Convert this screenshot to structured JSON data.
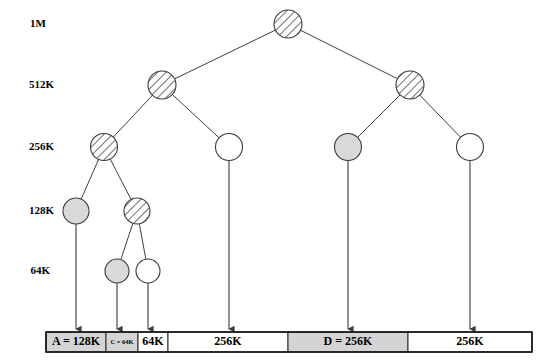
{
  "figure": {
    "colors": {
      "node_stroke": "#3a3a3a",
      "edge_stroke": "#3f3f3f",
      "fill_allocated": "#d9d9d9",
      "fill_free": "#ffffff",
      "hatch_stroke": "#4d4d4d",
      "segment_allocated": "#d4d4d4",
      "segment_free": "#ffffff",
      "text": "#000000"
    }
  },
  "levels": [
    {
      "label": "1M",
      "x": 46,
      "y": 27
    },
    {
      "label": "512K",
      "x": 54,
      "y": 88
    },
    {
      "label": "256K",
      "x": 54,
      "y": 150
    },
    {
      "label": "128K",
      "x": 54,
      "y": 214
    },
    {
      "label": "64K",
      "x": 50,
      "y": 274
    }
  ],
  "nodes": [
    {
      "id": "root",
      "level": "1M",
      "x": 288,
      "y": 24,
      "r": 14,
      "state": "split"
    },
    {
      "id": "n512-l",
      "level": "512K",
      "x": 162,
      "y": 85,
      "r": 14,
      "state": "split"
    },
    {
      "id": "n512-r",
      "level": "512K",
      "x": 410,
      "y": 85,
      "r": 14,
      "state": "split"
    },
    {
      "id": "n256-1",
      "level": "256K",
      "x": 104,
      "y": 147,
      "r": 13.5,
      "state": "split"
    },
    {
      "id": "n256-2",
      "level": "256K",
      "x": 229,
      "y": 147,
      "r": 13.5,
      "state": "free"
    },
    {
      "id": "n256-3",
      "level": "256K",
      "x": 348,
      "y": 147,
      "r": 13.5,
      "state": "allocated"
    },
    {
      "id": "n256-4",
      "level": "256K",
      "x": 470,
      "y": 147,
      "r": 13.5,
      "state": "free"
    },
    {
      "id": "n128-1",
      "level": "128K",
      "x": 76,
      "y": 211,
      "r": 13,
      "state": "allocated"
    },
    {
      "id": "n128-2",
      "level": "128K",
      "x": 137,
      "y": 211,
      "r": 13,
      "state": "split"
    },
    {
      "id": "n64-1",
      "level": "64K",
      "x": 117,
      "y": 271,
      "r": 12,
      "state": "allocated"
    },
    {
      "id": "n64-2",
      "level": "64K",
      "x": 148,
      "y": 271,
      "r": 12,
      "state": "free"
    }
  ],
  "edges": [
    {
      "from": "root",
      "to": "n512-l"
    },
    {
      "from": "root",
      "to": "n512-r"
    },
    {
      "from": "n512-l",
      "to": "n256-1"
    },
    {
      "from": "n512-l",
      "to": "n256-2"
    },
    {
      "from": "n512-r",
      "to": "n256-3"
    },
    {
      "from": "n512-r",
      "to": "n256-4"
    },
    {
      "from": "n256-1",
      "to": "n128-1"
    },
    {
      "from": "n256-1",
      "to": "n128-2"
    },
    {
      "from": "n128-2",
      "to": "n64-1"
    },
    {
      "from": "n128-2",
      "to": "n64-2"
    }
  ],
  "drop_arrows": [
    {
      "from_node": "n128-1",
      "x": 76,
      "y_start": 224,
      "y_end": 329
    },
    {
      "from_node": "n64-1",
      "x": 117,
      "y_start": 283,
      "y_end": 329
    },
    {
      "from_node": "n64-2",
      "x": 148,
      "y_start": 283,
      "y_end": 329
    },
    {
      "from_node": "n256-2",
      "x": 229,
      "y_start": 161,
      "y_end": 329
    },
    {
      "from_node": "n256-3",
      "x": 348,
      "y_start": 161,
      "y_end": 329
    },
    {
      "from_node": "n256-4",
      "x": 470,
      "y_start": 161,
      "y_end": 329
    }
  ],
  "memory_bar": {
    "x": 46,
    "y": 332,
    "width": 486,
    "height": 20,
    "segments": [
      {
        "label": "A = 128K",
        "x": 46,
        "width": 60,
        "state": "allocated",
        "size": "128K",
        "small_text": false
      },
      {
        "label": "C = 64K",
        "x": 106,
        "width": 32,
        "state": "allocated",
        "size": "64K",
        "small_text": true
      },
      {
        "label": "64K",
        "x": 138,
        "width": 30,
        "state": "free",
        "size": "64K",
        "small_text": false
      },
      {
        "label": "256K",
        "x": 168,
        "width": 120,
        "state": "free",
        "size": "256K",
        "small_text": false
      },
      {
        "label": "D = 256K",
        "x": 288,
        "width": 120,
        "state": "allocated",
        "size": "256K",
        "small_text": false
      },
      {
        "label": "256K",
        "x": 408,
        "width": 124,
        "state": "free",
        "size": "256K",
        "small_text": false
      }
    ]
  }
}
